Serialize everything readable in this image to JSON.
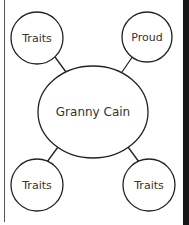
{
  "diagram": {
    "type": "web-organizer",
    "center": {
      "label": "Granny Cain"
    },
    "nodes": [
      {
        "position": "top-left",
        "label": "Traits"
      },
      {
        "position": "top-right",
        "label": "Proud"
      },
      {
        "position": "bottom-left",
        "label": "Traits"
      },
      {
        "position": "bottom-right",
        "label": "Traits"
      }
    ],
    "colors": {
      "stroke": "#222222",
      "text": "#333333",
      "background": "#ffffff",
      "edge_strip": "#151515"
    }
  }
}
